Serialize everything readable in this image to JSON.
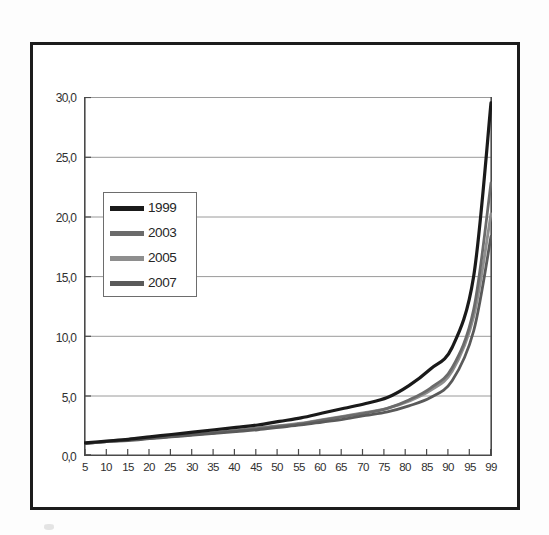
{
  "figure": {
    "title": "Com Contribuição para a Previdência Social",
    "frame_color": "#1c1c1c",
    "background": "#ffffff"
  },
  "legend": {
    "position": "inside-upper-left",
    "entries": [
      {
        "label": "1999",
        "color": "#1a1a1a"
      },
      {
        "label": "2003",
        "color": "#6b6b6b"
      },
      {
        "label": "2005",
        "color": "#8e8e8e"
      },
      {
        "label": "2007",
        "color": "#5a5a5a"
      }
    ]
  },
  "axes": {
    "y_ticks": [
      "0,0",
      "5,0",
      "10,0",
      "15,0",
      "20,0",
      "25,0",
      "30,0"
    ],
    "x_ticks": [
      "5",
      "10",
      "15",
      "20",
      "25",
      "30",
      "35",
      "40",
      "45",
      "50",
      "55",
      "60",
      "65",
      "70",
      "75",
      "80",
      "85",
      "90",
      "95",
      "99"
    ]
  },
  "chart_data": {
    "type": "line",
    "title": "Com Contribuição para a Previdência Social",
    "xlabel": "",
    "ylabel": "",
    "xlim": [
      5,
      99
    ],
    "ylim": [
      0,
      30
    ],
    "grid": true,
    "legend_position": "inside-upper-left",
    "x": [
      5,
      10,
      15,
      20,
      25,
      30,
      35,
      40,
      45,
      50,
      55,
      60,
      65,
      70,
      75,
      80,
      85,
      90,
      95,
      99
    ],
    "series": [
      {
        "name": "1999",
        "color": "#1a1a1a",
        "values": [
          1.0,
          1.15,
          1.3,
          1.5,
          1.7,
          1.9,
          2.1,
          2.3,
          2.5,
          2.8,
          3.1,
          3.5,
          3.9,
          4.3,
          4.8,
          5.8,
          7.2,
          9.0,
          15.0,
          29.5
        ]
      },
      {
        "name": "2003",
        "color": "#6b6b6b",
        "values": [
          0.95,
          1.1,
          1.25,
          1.4,
          1.55,
          1.7,
          1.85,
          2.0,
          2.2,
          2.4,
          2.6,
          2.9,
          3.2,
          3.5,
          3.9,
          4.6,
          5.6,
          7.3,
          12.2,
          22.8
        ]
      },
      {
        "name": "2005",
        "color": "#8e8e8e",
        "values": [
          0.95,
          1.1,
          1.25,
          1.4,
          1.55,
          1.7,
          1.85,
          2.05,
          2.25,
          2.45,
          2.65,
          2.95,
          3.25,
          3.55,
          3.9,
          4.5,
          5.4,
          7.0,
          11.6,
          20.2
        ]
      },
      {
        "name": "2007",
        "color": "#5a5a5a",
        "values": [
          0.95,
          1.1,
          1.2,
          1.35,
          1.5,
          1.65,
          1.8,
          1.95,
          2.1,
          2.3,
          2.5,
          2.75,
          3.0,
          3.3,
          3.6,
          4.1,
          4.8,
          6.2,
          10.4,
          18.3
        ]
      }
    ]
  }
}
